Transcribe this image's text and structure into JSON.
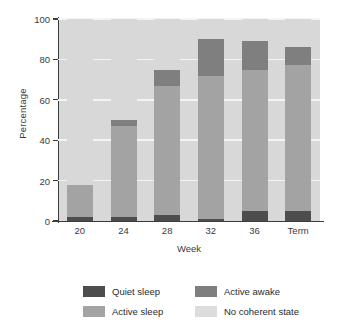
{
  "chart_data": {
    "type": "bar",
    "stacked": true,
    "title": "",
    "xlabel": "Week",
    "ylabel": "Percentage",
    "categories": [
      "20",
      "24",
      "28",
      "32",
      "36",
      "Term"
    ],
    "ylim": [
      0,
      100
    ],
    "yticks": [
      0,
      20,
      40,
      60,
      80,
      100
    ],
    "grid": true,
    "legend_position": "bottom",
    "series": [
      {
        "name": "Quiet sleep",
        "color": "#4d4d4d",
        "values": [
          2,
          2,
          3,
          1,
          5,
          5
        ]
      },
      {
        "name": "Active sleep",
        "color": "#a3a3a3",
        "values": [
          16,
          45,
          64,
          71,
          70,
          72
        ]
      },
      {
        "name": "Active awake",
        "color": "#7f7f7f",
        "values": [
          0,
          3,
          8,
          18,
          14,
          9
        ]
      },
      {
        "name": "No coherent state",
        "color": "#d8d8d8",
        "values": [
          82,
          50,
          25,
          10,
          11,
          14
        ]
      }
    ],
    "cumulative_tops": {
      "20": [
        2,
        18,
        18,
        100
      ],
      "24": [
        2,
        47,
        50,
        100
      ],
      "28": [
        3,
        67,
        75,
        100
      ],
      "32": [
        1,
        72,
        90,
        100
      ],
      "36": [
        5,
        75,
        89,
        100
      ],
      "Term": [
        5,
        77,
        86,
        100
      ]
    }
  },
  "legend": {
    "items": [
      {
        "label": "Quiet sleep",
        "color": "#4d4d4d"
      },
      {
        "label": "Active awake",
        "color": "#7f7f7f"
      },
      {
        "label": "Active sleep",
        "color": "#a3a3a3"
      },
      {
        "label": "No coherent state",
        "color": "#dcdcdc"
      }
    ]
  },
  "axes": {
    "y_title": "Percentage",
    "x_title": "Week",
    "y_ticks": [
      "0",
      "20",
      "40",
      "60",
      "80",
      "100"
    ],
    "x_ticks": [
      "20",
      "24",
      "28",
      "32",
      "36",
      "Term"
    ]
  }
}
